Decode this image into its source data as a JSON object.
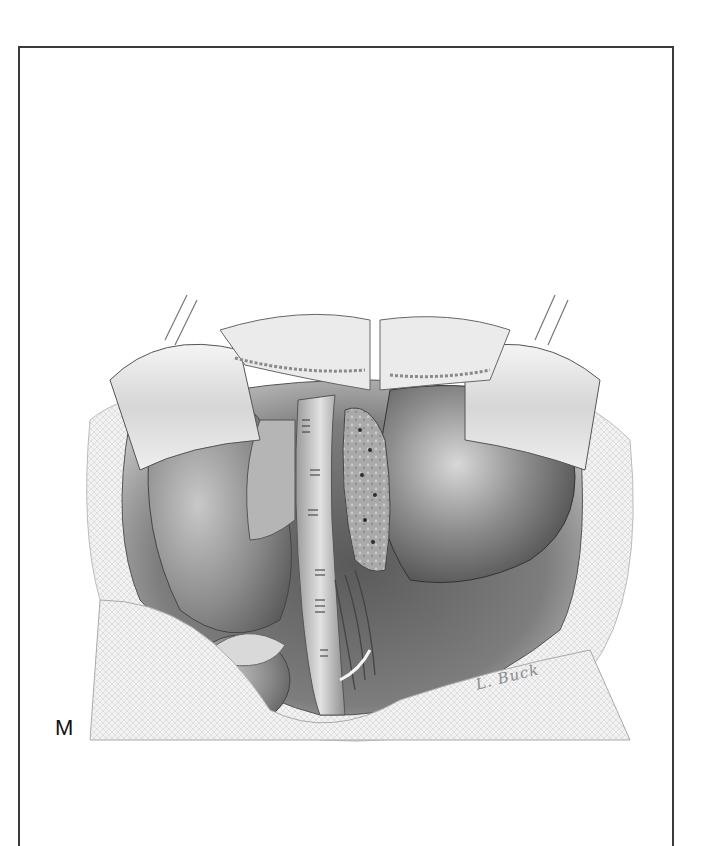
{
  "figure": {
    "panel_label": "M",
    "signature": "L. Buck"
  }
}
